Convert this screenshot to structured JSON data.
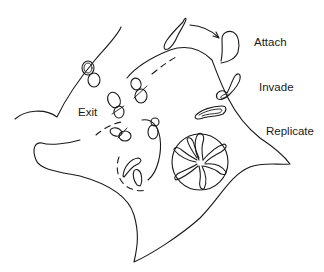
{
  "diagram": {
    "type": "biology-lifecycle-line-drawing",
    "labels": {
      "attach": "Attach",
      "invade": "Invade",
      "replicate": "Replicate",
      "exit": "Exit"
    },
    "stages_order": [
      "Attach",
      "Invade",
      "Replicate",
      "Exit"
    ],
    "colors": {
      "stroke": "#1a1a1a",
      "background": "#ffffff"
    }
  }
}
